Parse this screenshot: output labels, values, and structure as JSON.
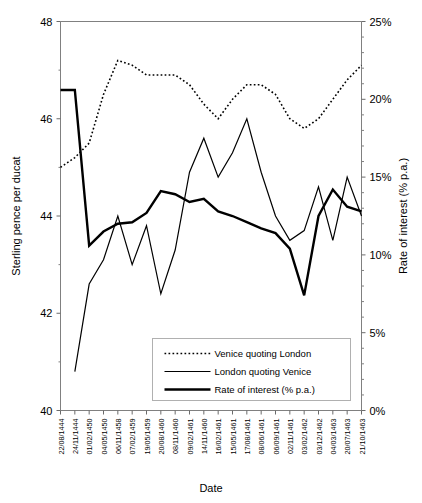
{
  "chart_data": {
    "type": "line",
    "title": "",
    "xlabel": "Date",
    "ylabel": "Sterling pence per ducat",
    "y2label": "Rate of interest (% p.a.)",
    "ylim": [
      40,
      48
    ],
    "y2lim": [
      0,
      25
    ],
    "yticks": [
      40,
      42,
      44,
      46,
      48
    ],
    "yticklabels": [
      "40",
      "42",
      "44",
      "46",
      "48"
    ],
    "y2ticks": [
      0,
      5,
      10,
      15,
      20,
      25
    ],
    "y2ticklabels": [
      "0%",
      "5%",
      "10%",
      "15%",
      "20%",
      "25%"
    ],
    "grid": false,
    "legend_position": "lower center",
    "categories": [
      "22/08/1444",
      "24/11/1444",
      "01/02/1450",
      "04/05/1450",
      "06/11/1458",
      "07/02/1459",
      "19/05/1459",
      "20/08/1460",
      "08/11/1460",
      "09/02/1461",
      "14/11/1460",
      "16/02/1461",
      "15/05/1461",
      "17/08/1461",
      "08/06/1461",
      "06/09/1461",
      "02/11/1461",
      "03/02/1462",
      "03/12/1462",
      "04/03/1463",
      "20/07/1463",
      "21/10/1463"
    ],
    "series": [
      {
        "name": "Venice quoting London",
        "axis": "left",
        "style": "dotted",
        "values": [
          45.0,
          45.2,
          45.5,
          46.5,
          47.2,
          47.1,
          46.9,
          46.9,
          46.9,
          46.7,
          46.3,
          46.0,
          46.4,
          46.7,
          46.7,
          46.5,
          46.0,
          45.8,
          46.0,
          46.4,
          46.8,
          47.1
        ]
      },
      {
        "name": "London quoting Venice",
        "axis": "left",
        "style": "thin",
        "values": [
          null,
          40.8,
          42.6,
          43.1,
          44.0,
          43.0,
          43.8,
          42.4,
          43.3,
          44.9,
          45.6,
          44.8,
          45.3,
          46.0,
          44.9,
          44.0,
          43.5,
          43.7,
          44.6,
          43.5,
          44.8,
          44.0
        ]
      },
      {
        "name": "Rate of interest (% p.a.)",
        "axis": "right",
        "style": "thick",
        "values": [
          20.6,
          20.6,
          10.6,
          11.5,
          12.0,
          12.1,
          12.7,
          14.1,
          13.9,
          13.4,
          13.6,
          12.8,
          12.5,
          12.1,
          11.7,
          11.4,
          10.4,
          7.4,
          12.5,
          14.2,
          13.1,
          12.8
        ]
      }
    ],
    "legend": [
      {
        "label": "Venice quoting London",
        "style": "dotted"
      },
      {
        "label": "London quoting Venice",
        "style": "thin"
      },
      {
        "label": "Rate of interest (% p.a.)",
        "style": "thick"
      }
    ]
  }
}
